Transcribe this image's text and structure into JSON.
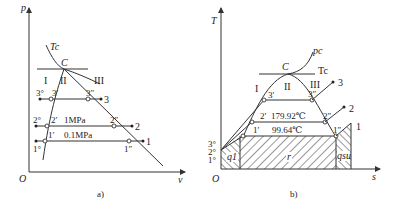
{
  "figure_a": {
    "caption": "a)",
    "y_axis_label": "p",
    "x_axis_label": "v",
    "origin_label": "O",
    "critical_isotherm_label": "Tc",
    "critical_point_label": "C",
    "region_labels": [
      "I",
      "II",
      "III"
    ],
    "points": {
      "p3_liq": "3°",
      "p3_sat_liq": "3′",
      "p3_sat_vap": "3″",
      "p3": "3",
      "p2_liq": "2°",
      "p2_sat_liq": "2′",
      "p2_sat_vap": "2″",
      "p2": "2",
      "p1_liq": "1°",
      "p1_sat_liq": "1′",
      "p1_sat_vap": "1″",
      "p1": "1"
    },
    "isobar_labels": {
      "p2": "1MPa",
      "p1": "0.1MPa"
    }
  },
  "figure_b": {
    "caption": "b)",
    "y_axis_label": "T",
    "x_axis_label": "s",
    "origin_label": "O",
    "critical_isobar_label": "pc",
    "critical_isotherm_label": "Tc",
    "critical_point_label": "C",
    "region_labels": [
      "I",
      "II",
      "III"
    ],
    "points": {
      "p3_liq": "3°",
      "p3_sat_liq": "3′",
      "p3_sat_vap": "3″",
      "p3": "3",
      "p2_liq": "2°",
      "p2_sat_liq": "2′",
      "p2_sat_vap": "2″",
      "p2": "2",
      "p1_liq": "1°",
      "p1_sat_liq": "1′",
      "p1_sat_vap": "1″",
      "p1": "1"
    },
    "isotherm_labels": {
      "t2": "179.92℃",
      "t1": "99.64℃"
    },
    "area_labels": {
      "q1": "q1",
      "r": "r",
      "qsu": "qsu"
    }
  }
}
